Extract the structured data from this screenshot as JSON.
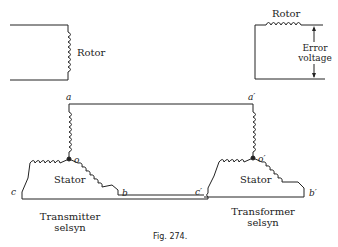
{
  "diagram": {
    "left_rotor": {
      "label": "Rotor"
    },
    "right_rotor": {
      "label": "Rotor",
      "output_label_line1": "Error",
      "output_label_line2": "voltage"
    },
    "transmitter": {
      "stator_label": "Stator",
      "caption_line1": "Transmitter",
      "caption_line2": "selsyn",
      "terminals": {
        "a": "a",
        "b": "b",
        "c": "c",
        "o": "o"
      }
    },
    "transformer": {
      "stator_label": "Stator",
      "caption_line1": "Transformer",
      "caption_line2": "selsyn",
      "terminals": {
        "a": "a′",
        "b": "b′",
        "c": "c′",
        "o": "o′"
      }
    },
    "figure_caption": "Fig. 274.",
    "colors": {
      "ink": "#222222",
      "background": "#ffffff"
    }
  }
}
